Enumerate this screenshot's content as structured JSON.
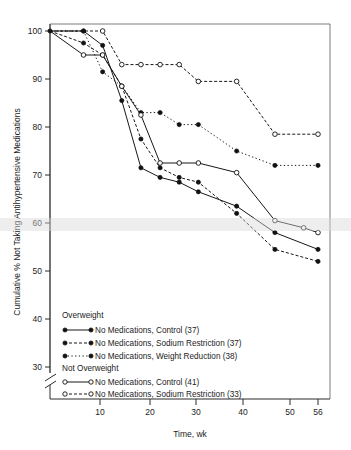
{
  "chart_data": {
    "type": "line",
    "title": "",
    "xlabel": "Time, wk",
    "ylabel": "Cumulative % Not Taking Antihypertensive Medications",
    "xlim": [
      0,
      58
    ],
    "ylim": [
      28,
      101
    ],
    "xticks": [
      10,
      20,
      30,
      40,
      50,
      56
    ],
    "yticks": [
      100,
      90,
      80,
      70,
      60,
      50,
      40,
      30
    ],
    "xtick_labels": [
      "10",
      "20",
      "30",
      "40",
      "50",
      "56"
    ],
    "ytick_labels": [
      "100",
      "90",
      "80",
      "70",
      "60",
      "50",
      "40",
      "30"
    ],
    "grid": false,
    "legend_position": "lower-left-inside",
    "axis_break": {
      "x_axis": true,
      "y_axis": true,
      "note": "break symbol near origin on both axes"
    },
    "series": [
      {
        "name": "No Medications, Control (37)",
        "group": "Overweight",
        "marker": "filled-circle",
        "linestyle": "solid",
        "n": 37,
        "x": [
          0,
          7,
          11,
          15,
          19,
          23,
          27,
          31,
          39,
          47,
          56
        ],
        "y": [
          100,
          100,
          97,
          85.5,
          71.5,
          69.5,
          68.5,
          66.5,
          63.5,
          58,
          54.5
        ]
      },
      {
        "name": "No Medications, Sodium Restriction (37)",
        "group": "Overweight",
        "marker": "filled-circle",
        "linestyle": "dashed",
        "n": 37,
        "x": [
          0,
          7,
          11,
          15,
          19,
          23,
          27,
          31,
          39,
          47,
          56
        ],
        "y": [
          100,
          97.5,
          95,
          88.5,
          77.5,
          71.5,
          69.5,
          68.5,
          62,
          54.5,
          52
        ]
      },
      {
        "name": "No Medications, Weight Reduction (38)",
        "group": "Overweight",
        "marker": "filled-circle",
        "linestyle": "dotted",
        "n": 38,
        "x": [
          0,
          7,
          11,
          15,
          19,
          23,
          27,
          31,
          39,
          47,
          56
        ],
        "y": [
          100,
          100,
          91.5,
          88.5,
          83,
          83,
          80.5,
          80.5,
          75,
          72,
          72
        ]
      },
      {
        "name": "No Medications, Control (41)",
        "group": "Not Overweight",
        "marker": "open-circle",
        "linestyle": "solid",
        "n": 41,
        "x": [
          0,
          7,
          11,
          15,
          19,
          23,
          27,
          31,
          39,
          47,
          53,
          56
        ],
        "y": [
          100,
          95,
          95,
          88.5,
          82.5,
          72.5,
          72.5,
          72.5,
          70.5,
          60.5,
          59,
          58
        ]
      },
      {
        "name": "No Medications, Sodium Restriction (33)",
        "group": "Not Overweight",
        "marker": "open-circle",
        "linestyle": "dashed",
        "n": 33,
        "x": [
          0,
          11,
          15,
          19,
          23,
          27,
          31,
          39,
          47,
          56
        ],
        "y": [
          100,
          100,
          93,
          93,
          93,
          93,
          89.5,
          89.5,
          78.5,
          78.5
        ]
      }
    ]
  },
  "axis": {
    "y_title": "Cumulative % Not Taking Antihypertensive Medications",
    "x_title": "Time, wk",
    "y_labels": [
      "100",
      "90",
      "80",
      "70",
      "60",
      "50",
      "40",
      "30"
    ],
    "x_labels": [
      "10",
      "20",
      "30",
      "40",
      "50",
      "56"
    ]
  },
  "legend": {
    "group_overweight": "Overweight",
    "group_not_overweight": "Not Overweight",
    "entries": [
      {
        "label": "No Medications, Control (37)"
      },
      {
        "label": "No Medications, Sodium Restriction (37)"
      },
      {
        "label": "No Medications, Weight Reduction (38)"
      },
      {
        "label": "No Medications, Control (41)"
      },
      {
        "label": "No Medications, Sodium Restriction (33)"
      }
    ]
  }
}
